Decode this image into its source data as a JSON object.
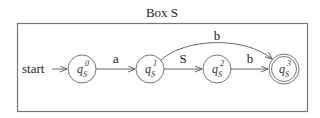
{
  "box": {
    "title": "Box S"
  },
  "start_label": "start",
  "states": [
    {
      "id": "q0",
      "base": "q",
      "sub": "S",
      "sup": "0",
      "accepting": false
    },
    {
      "id": "q1",
      "base": "q",
      "sub": "S",
      "sup": "1",
      "accepting": false
    },
    {
      "id": "q2",
      "base": "q",
      "sub": "S",
      "sup": "2",
      "accepting": false
    },
    {
      "id": "q3",
      "base": "q",
      "sub": "S",
      "sup": "3",
      "accepting": true
    }
  ],
  "transitions": [
    {
      "from": "q0",
      "to": "q1",
      "label": "a"
    },
    {
      "from": "q1",
      "to": "q2",
      "label": "S"
    },
    {
      "from": "q2",
      "to": "q3",
      "label": "b"
    },
    {
      "from": "q1",
      "to": "q3",
      "label": "b",
      "curved": true
    }
  ],
  "colors": {
    "stroke": "#555555",
    "box": "#777777",
    "text": "#222222"
  }
}
